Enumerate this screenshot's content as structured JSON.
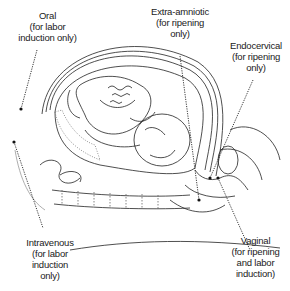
{
  "diagram": {
    "labels": [
      {
        "id": "oral",
        "lines": [
          "Oral",
          "(for labor",
          "induction only)"
        ]
      },
      {
        "id": "extra-amniotic",
        "lines": [
          "Extra-amniotic",
          "(for ripening",
          "only)"
        ]
      },
      {
        "id": "endocervical",
        "lines": [
          "Endocervical",
          "(for ripening",
          "only)"
        ]
      },
      {
        "id": "intravenous",
        "lines": [
          "Intravenous",
          "(for labor",
          "induction",
          "only)"
        ]
      },
      {
        "id": "vaginal",
        "lines": [
          "Vaginal",
          "(for ripening",
          "and labor",
          "induction)"
        ]
      }
    ],
    "colors": {
      "line": "#222222",
      "background": "#ffffff",
      "stipple": "#888888"
    }
  }
}
